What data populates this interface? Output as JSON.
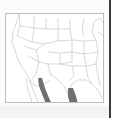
{
  "map": {
    "region": "United States and northern Mexico",
    "type": "range map",
    "colors": {
      "border": "#bdbdbd",
      "state_lines": "#c4c4c4",
      "range_fill": "#707070",
      "background": "#ffffff"
    },
    "shaded_ranges": [
      {
        "label": "western-range",
        "area": "Sierra Madre Occidental"
      },
      {
        "label": "eastern-range",
        "area": "Sierra Madre Oriental"
      }
    ]
  }
}
